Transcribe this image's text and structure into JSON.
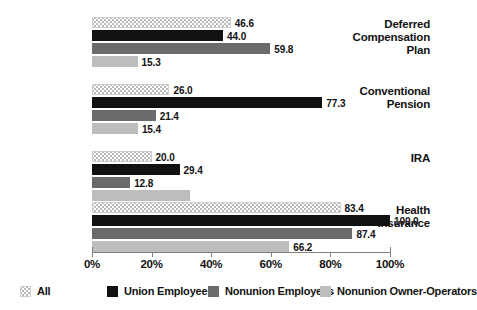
{
  "chart_data": {
    "type": "bar",
    "orientation": "horizontal",
    "grouped": true,
    "title": "",
    "xlabel": "",
    "ylabel": "",
    "xlim": [
      0,
      100
    ],
    "xticks": [
      0,
      20,
      40,
      60,
      80,
      100
    ],
    "xtick_labels": [
      "0%",
      "20%",
      "40%",
      "60%",
      "80%",
      "100%"
    ],
    "grid": false,
    "legend_position": "bottom",
    "categories": [
      "Deferred Compensation Plan",
      "Conventional Pension",
      "IRA",
      "Health Insurance"
    ],
    "series": [
      {
        "name": "All",
        "swatch": "hatch-light",
        "color": "#b9b9b9",
        "values": [
          46.6,
          26.0,
          20.0,
          83.4
        ],
        "labels": [
          "46.6",
          "26.0",
          "20.0",
          "83.4"
        ]
      },
      {
        "name": "Union Employees",
        "swatch": "solid",
        "color": "#111111",
        "values": [
          44.0,
          77.3,
          29.4,
          100.0
        ],
        "labels": [
          "44.0",
          "77.3",
          "29.4",
          "100.0"
        ]
      },
      {
        "name": "Nonunion Employees",
        "swatch": "solid",
        "color": "#6b6b6b",
        "values": [
          59.8,
          21.4,
          12.8,
          87.4
        ],
        "labels": [
          "59.8",
          "21.4",
          "12.8",
          "87.4"
        ]
      },
      {
        "name": "Nonunion Owner-Operators",
        "swatch": "solid",
        "color": "#bdbdbd",
        "values": [
          15.3,
          15.4,
          33.0,
          66.2
        ],
        "labels": [
          "15.3",
          "15.4",
          "",
          "66.2"
        ]
      }
    ]
  }
}
